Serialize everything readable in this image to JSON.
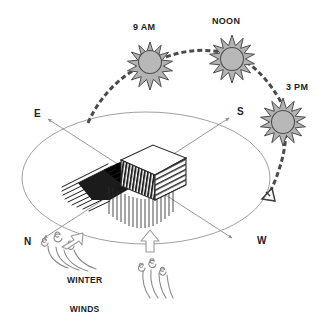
{
  "diagram": {
    "palette": {
      "sun_fill": "#b3b3b3",
      "sun_stroke": "#4d4d4d",
      "path_stroke": "#4a4a4a",
      "ellipse_stroke": "#9a9a9a",
      "axis_stroke": "#8c8c8c",
      "wind_stroke": "#8a8a8a",
      "building_dark": "#2b2b2b",
      "building_top": "#ffffff",
      "shadow": "#000000",
      "text": "#222222",
      "background": "#ffffff"
    },
    "sun_positions": [
      {
        "id": "sun-9am",
        "label": "9 AM",
        "cx": 150,
        "cy": 62,
        "r": 15,
        "rays": 16,
        "label_x": 133,
        "label_y": 22
      },
      {
        "id": "sun-noon",
        "label": "NOON",
        "cx": 232,
        "cy": 55,
        "r": 15,
        "rays": 16,
        "label_x": 212,
        "label_y": 16
      },
      {
        "id": "sun-3pm",
        "label": "3 PM",
        "cx": 283,
        "cy": 118,
        "r": 15,
        "rays": 16,
        "label_x": 286,
        "label_y": 82
      }
    ],
    "compass_points": [
      {
        "id": "compass-e",
        "label": "E",
        "x": 34,
        "y": 108
      },
      {
        "id": "compass-s",
        "label": "S",
        "x": 237,
        "y": 106
      },
      {
        "id": "compass-n",
        "label": "N",
        "x": 24,
        "y": 236
      },
      {
        "id": "compass-w",
        "label": "W",
        "x": 257,
        "y": 235
      }
    ],
    "wind_label": {
      "id": "winter-winds-label",
      "line1": "WINTER",
      "line2": "WINDS",
      "x": 67,
      "y": 257
    },
    "sun_path": {
      "description": "dashed arc from lower-left horizon rising through 9 AM, NOON, 3 PM and descending to an arrowhead at the west horizon",
      "dash_pattern": "5 3",
      "stroke_width": 3
    },
    "ground_ellipse": {
      "cx": 146,
      "cy": 178,
      "rx": 124,
      "ry": 66
    },
    "building": {
      "id": "building-block",
      "description": "isometric block with white roof, dark hatched south-east face, lined south-west face, dark cast shadow to the north-west and vertical hatching below"
    },
    "wind_arrows": [
      {
        "id": "wind-arrow-northwest",
        "direction": "up-right",
        "x": 64,
        "y": 232
      },
      {
        "id": "wind-arrow-south",
        "direction": "up",
        "x": 150,
        "y": 236
      }
    ],
    "wind_swirls": [
      {
        "id": "wind-swirls-north",
        "x": 42,
        "y": 240
      },
      {
        "id": "wind-swirls-south",
        "x": 150,
        "y": 266
      }
    ]
  }
}
